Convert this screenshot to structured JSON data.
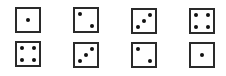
{
  "figure": {
    "rows": [
      {
        "label": "top-row",
        "dice": [
          {
            "value": 1,
            "x": 15,
            "y": 7,
            "rotate": 0,
            "pips": [
              [
                11,
                11
              ]
            ]
          },
          {
            "value": 2,
            "x": 73,
            "y": 7,
            "rotate": 0,
            "pips": [
              [
                5,
                5
              ],
              [
                17,
                17
              ]
            ]
          },
          {
            "value": 3,
            "x": 131,
            "y": 8,
            "rotate": 0,
            "pips": [
              [
                17,
                5
              ],
              [
                11,
                11
              ],
              [
                5,
                17
              ]
            ]
          },
          {
            "value": 4,
            "x": 189,
            "y": 8,
            "rotate": 0,
            "pips": [
              [
                5,
                5
              ],
              [
                17,
                5
              ],
              [
                5,
                17
              ],
              [
                17,
                17
              ]
            ]
          }
        ]
      },
      {
        "label": "bottom-row",
        "dice": [
          {
            "value": 4,
            "x": 15,
            "y": 41,
            "rotate": 0,
            "pips": [
              [
                5,
                5
              ],
              [
                17,
                5
              ],
              [
                5,
                17
              ],
              [
                17,
                17
              ]
            ]
          },
          {
            "value": 3,
            "x": 73,
            "y": 42,
            "rotate": 0,
            "pips": [
              [
                17,
                5
              ],
              [
                11,
                11
              ],
              [
                5,
                17
              ]
            ]
          },
          {
            "value": 2,
            "x": 131,
            "y": 42,
            "rotate": 0,
            "pips": [
              [
                5,
                5
              ],
              [
                17,
                17
              ]
            ]
          },
          {
            "value": 1,
            "x": 189,
            "y": 42,
            "rotate": 0,
            "pips": [
              [
                11,
                11
              ]
            ]
          }
        ]
      }
    ],
    "colors": {
      "stroke": "#2a2a2a",
      "pip": "#111111",
      "background": "#ffffff"
    }
  }
}
